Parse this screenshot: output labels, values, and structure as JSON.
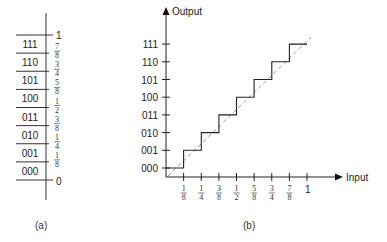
{
  "panel_a": {
    "caption": "(a)",
    "top_label": "1",
    "bottom_label": "0",
    "codes": [
      "111",
      "110",
      "101",
      "100",
      "011",
      "010",
      "001",
      "000"
    ],
    "thresholds": [
      {
        "num": "7",
        "den": "8"
      },
      {
        "num": "3",
        "den": "4"
      },
      {
        "num": "5",
        "den": "8"
      },
      {
        "num": "1",
        "den": "2"
      },
      {
        "num": "3",
        "den": "8"
      },
      {
        "num": "1",
        "den": "4"
      },
      {
        "num": "1",
        "den": "8"
      }
    ]
  },
  "panel_b": {
    "caption": "(b)",
    "y_axis_label": "Output",
    "x_axis_label": "Input",
    "y_ticks": [
      "111",
      "110",
      "101",
      "100",
      "011",
      "010",
      "001",
      "000"
    ],
    "x_ticks": [
      {
        "num": "1",
        "den": "8"
      },
      {
        "num": "1",
        "den": "4"
      },
      {
        "num": "3",
        "den": "8"
      },
      {
        "num": "1",
        "den": "2"
      },
      {
        "num": "5",
        "den": "8"
      },
      {
        "num": "3",
        "den": "4"
      },
      {
        "num": "7",
        "den": "8"
      }
    ],
    "x_end_label": "1"
  },
  "chart_data": {
    "type": "line",
    "xlabel": "Input",
    "ylabel": "Output",
    "x_tick_labels": [
      "1/8",
      "1/4",
      "3/8",
      "1/2",
      "5/8",
      "3/4",
      "7/8",
      "1"
    ],
    "y_tick_labels": [
      "000",
      "001",
      "010",
      "011",
      "100",
      "101",
      "110",
      "111"
    ],
    "series": [
      {
        "name": "quantized output (staircase)",
        "x": [
          0,
          0.125,
          0.125,
          0.25,
          0.25,
          0.375,
          0.375,
          0.5,
          0.5,
          0.625,
          0.625,
          0.75,
          0.75,
          0.875,
          0.875,
          1.0
        ],
        "y": [
          0,
          0,
          1,
          1,
          2,
          2,
          3,
          3,
          4,
          4,
          5,
          5,
          6,
          6,
          7,
          7
        ]
      },
      {
        "name": "ideal (dashed diagonal)",
        "x": [
          0,
          1.0
        ],
        "y": [
          -0.5,
          7.5
        ]
      }
    ],
    "xlim": [
      0,
      1.0
    ],
    "ylim": [
      0,
      7
    ]
  }
}
